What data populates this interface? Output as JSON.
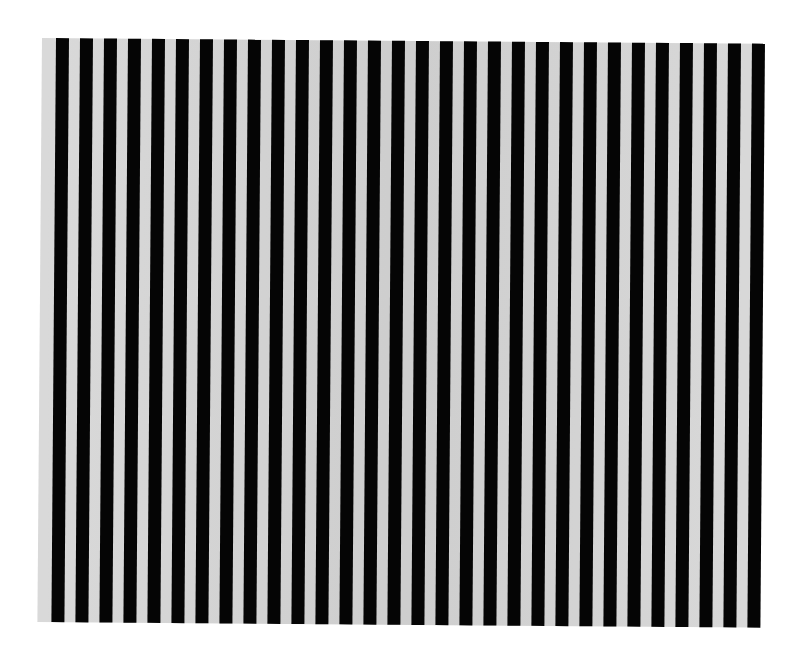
{
  "image": {
    "subject": "vertical black and light-gray stripe pattern",
    "stripe_count": 30,
    "colors": {
      "dark": "#050505",
      "light": "#d6d6d6",
      "background": "#ffffff"
    },
    "stripe_period_px": 24,
    "dark_width_px": 13
  }
}
